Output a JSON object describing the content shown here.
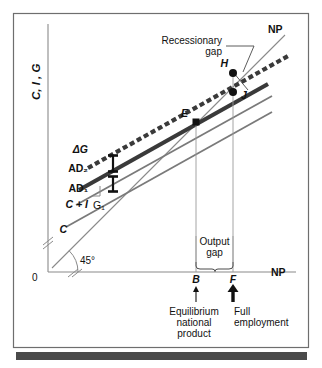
{
  "figure": {
    "type": "economics-diagram",
    "name": "Keynesian cross — recessionary gap and government spending shift",
    "frame_color": "#6e6e6e",
    "background": "#ffffff",
    "footer_bar_color": "#4a4a4a"
  },
  "axes": {
    "y_label": "C, I , G",
    "x_label": "NP",
    "origin_label": "0",
    "angle_label": "45°",
    "axis_color": "#8a8a8a",
    "break_marks": 2
  },
  "lines": [
    {
      "id": "np45",
      "label": "NP",
      "style": "thin-solid",
      "color": "#8a8a8a",
      "desc": "45 degree line"
    },
    {
      "id": "ad2",
      "label": "AD₂",
      "style": "thick-dashed",
      "color": "#3a3a3a",
      "desc": "aggregate demand after increase in G"
    },
    {
      "id": "ad1",
      "label": "AD₁",
      "style": "thick-solid",
      "color": "#3a3a3a",
      "desc": "aggregate demand C+I+G1"
    },
    {
      "id": "cplusi",
      "label": "C + I",
      "style": "medium-solid",
      "color": "#7a7a7a",
      "desc": "consumption plus investment"
    },
    {
      "id": "c",
      "label": "C",
      "style": "medium-solid",
      "color": "#7a7a7a",
      "desc": "consumption function"
    }
  ],
  "curve_labels": {
    "delta_g": "ΔG",
    "ad2": "AD₂",
    "ad1": "AD₁",
    "c_plus_i": "C + I",
    "g1": "G₁",
    "c": "C",
    "np_top": "NP"
  },
  "points": [
    {
      "id": "E",
      "label": "E",
      "x_axis_tick": "B",
      "on_line": "ad1"
    },
    {
      "id": "H",
      "label": "H",
      "x_axis_tick": "F",
      "on_line": "ad2"
    },
    {
      "id": "J",
      "label": "J",
      "x_axis_tick": "F",
      "on_line": "ad1"
    }
  ],
  "x_ticks": [
    {
      "label": "B",
      "caption": "Equilibrium\nnational\nproduct",
      "arrow": "thin"
    },
    {
      "label": "F",
      "caption": "Full\nemployment",
      "arrow": "thick"
    }
  ],
  "annotations": {
    "recessionary_gap": "Recessionary\ngap",
    "recessionary_gap_line1": "Recessionary",
    "recessionary_gap_line2": "gap",
    "output_gap_line1": "Output",
    "output_gap_line2": "gap",
    "equilibrium_line1": "Equilibrium",
    "equilibrium_line2": "national",
    "equilibrium_line3": "product",
    "full_employment_line1": "Full",
    "full_employment_line2": "employment"
  }
}
